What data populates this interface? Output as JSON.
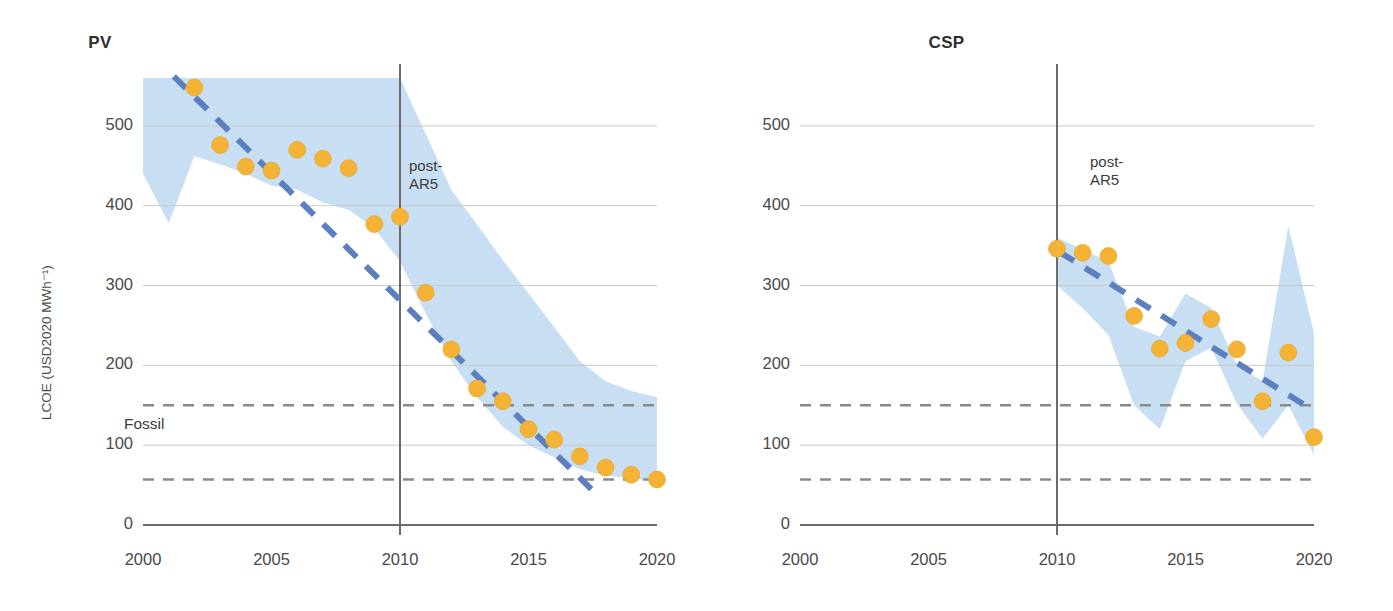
{
  "figure": {
    "background": "#ffffff",
    "axis_title_y": "LCOE (USD2020 MWh⁻¹)",
    "fossil_label": "Fossil",
    "annotation": "post-\nAR5",
    "colors": {
      "marker": "#F5B335",
      "marker_stroke": "#E8A72B",
      "trend": "#5C7FC0",
      "band": "#C5DCF2",
      "grid": "#c9c9c9",
      "axis": "#6b6b6b",
      "fossil_dash": "#8a8a8a",
      "text": "#3c3c3c"
    }
  },
  "chart_data": [
    {
      "type": "scatter",
      "title": "PV",
      "xlabel": "",
      "ylabel": "LCOE (USD2020 MWh⁻¹)",
      "xlim": [
        2000,
        2020
      ],
      "ylim": [
        0,
        560
      ],
      "xticks": [
        2000,
        2005,
        2010,
        2015,
        2020
      ],
      "xticklabels": [
        "2000",
        "2005",
        "2010",
        "2015",
        "2020"
      ],
      "yticks": [
        0,
        100,
        200,
        300,
        400,
        500
      ],
      "yticklabels": [
        "0",
        "100",
        "200",
        "300",
        "400",
        "500"
      ],
      "grid": "horizontal",
      "legend": "none",
      "annotations": [
        {
          "text": "post-AR5",
          "x": 2011.0,
          "y": 445
        },
        {
          "text": "Fossil",
          "x": 2000.6,
          "y": 125
        }
      ],
      "reference_lines": [
        {
          "label": "fossil-upper",
          "y": 150,
          "style": "dashed",
          "color": "#8a8a8a"
        },
        {
          "label": "fossil-lower",
          "y": 57,
          "style": "dashed",
          "color": "#8a8a8a"
        }
      ],
      "vertical_marker": {
        "label": "post-AR5 divider",
        "x": 2010
      },
      "series": [
        {
          "name": "PV global weighted-average LCOE",
          "kind": "markers",
          "x": [
            2002,
            2003,
            2004,
            2005,
            2006,
            2007,
            2008,
            2009,
            2010,
            2011,
            2012,
            2013,
            2014,
            2015,
            2016,
            2017,
            2018,
            2019,
            2020
          ],
          "values": [
            548,
            476,
            449,
            444,
            470,
            459,
            447,
            377,
            386,
            291,
            220,
            171,
            155,
            120,
            107,
            86,
            72,
            63,
            57
          ]
        },
        {
          "name": "PV trend line",
          "kind": "dashed-line",
          "x": [
            2001.2,
            2017.6
          ],
          "values": [
            562,
            40
          ]
        },
        {
          "name": "PV cost range band",
          "kind": "band",
          "x": [
            2000,
            2001,
            2002,
            2003,
            2004,
            2005,
            2006,
            2007,
            2008,
            2009,
            2010,
            2011,
            2012,
            2013,
            2014,
            2015,
            2016,
            2017,
            2018,
            2019,
            2020
          ],
          "upper": [
            560,
            560,
            560,
            560,
            560,
            560,
            560,
            560,
            560,
            560,
            560,
            490,
            420,
            376,
            332,
            290,
            248,
            205,
            180,
            168,
            160
          ],
          "lower": [
            440,
            378,
            462,
            452,
            440,
            425,
            420,
            404,
            395,
            372,
            330,
            265,
            205,
            160,
            123,
            100,
            85,
            70,
            62,
            58,
            55
          ]
        }
      ]
    },
    {
      "type": "scatter",
      "title": "CSP",
      "xlabel": "",
      "ylabel": "",
      "xlim": [
        2000,
        2020
      ],
      "ylim": [
        0,
        560
      ],
      "xticks": [
        2000,
        2005,
        2010,
        2015,
        2020
      ],
      "xticklabels": [
        "2000",
        "2005",
        "2010",
        "2015",
        "2020"
      ],
      "yticks": [
        0,
        100,
        200,
        300,
        400,
        500
      ],
      "yticklabels": [
        "0",
        "100",
        "200",
        "300",
        "400",
        "500"
      ],
      "grid": "horizontal",
      "legend": "none",
      "annotations": [
        {
          "text": "post-AR5",
          "x": 2011.0,
          "y": 450
        }
      ],
      "reference_lines": [
        {
          "label": "fossil-upper",
          "y": 150,
          "style": "dashed",
          "color": "#8a8a8a"
        },
        {
          "label": "fossil-lower",
          "y": 57,
          "style": "dashed",
          "color": "#8a8a8a"
        }
      ],
      "vertical_marker": {
        "label": "post-AR5 divider",
        "x": 2010
      },
      "series": [
        {
          "name": "CSP global weighted-average LCOE",
          "kind": "markers",
          "x": [
            2010,
            2011,
            2012,
            2013,
            2014,
            2015,
            2016,
            2017,
            2018,
            2019,
            2020
          ],
          "values": [
            346,
            341,
            337,
            262,
            221,
            228,
            258,
            220,
            155,
            216,
            110
          ]
        },
        {
          "name": "CSP trend line",
          "kind": "dashed-line",
          "x": [
            2010.1,
            2020.0
          ],
          "values": [
            342,
            143
          ]
        },
        {
          "name": "CSP cost range band",
          "kind": "band",
          "x": [
            2010,
            2011,
            2012,
            2013,
            2014,
            2015,
            2016,
            2017,
            2018,
            2019,
            2020
          ],
          "upper": [
            360,
            345,
            330,
            248,
            236,
            290,
            272,
            200,
            180,
            375,
            240
          ],
          "lower": [
            300,
            272,
            238,
            150,
            120,
            205,
            222,
            152,
            108,
            150,
            88
          ]
        }
      ]
    }
  ]
}
